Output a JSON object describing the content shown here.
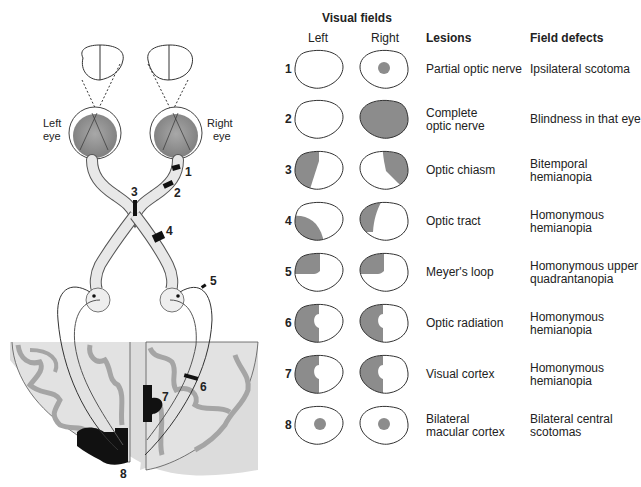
{
  "header": {
    "visual_fields": "Visual fields",
    "left": "Left",
    "right": "Right",
    "lesions": "Lesions",
    "field_defects": "Field defects"
  },
  "anatomy": {
    "left_eye": [
      "Left",
      "eye"
    ],
    "right_eye": [
      "Right",
      "eye"
    ],
    "markers": [
      "1",
      "2",
      "3",
      "4",
      "5",
      "6",
      "7",
      "8"
    ]
  },
  "rows": [
    {
      "num": "1",
      "lesion": [
        "Partial optic nerve"
      ],
      "defect": [
        "Ipsilateral scotoma"
      ],
      "left_field": "normal",
      "right_field": "central-scotoma"
    },
    {
      "num": "2",
      "lesion": [
        "Complete",
        "optic nerve"
      ],
      "defect": [
        "Blindness in that eye"
      ],
      "left_field": "normal",
      "right_field": "full-blind"
    },
    {
      "num": "3",
      "lesion": [
        "Optic chiasm"
      ],
      "defect": [
        "Bitemporal",
        "hemianopia"
      ],
      "left_field": "temporal-left",
      "right_field": "temporal-right"
    },
    {
      "num": "4",
      "lesion": [
        "Optic tract"
      ],
      "defect": [
        "Homonymous",
        "hemianopia"
      ],
      "left_field": "left-half-lower",
      "right_field": "left-half-upper"
    },
    {
      "num": "5",
      "lesion": [
        "Meyer's loop"
      ],
      "defect": [
        "Homonymous upper",
        "quadrantanopia"
      ],
      "left_field": "upper-left-quadrant",
      "right_field": "upper-left-quadrant"
    },
    {
      "num": "6",
      "lesion": [
        "Optic radiation"
      ],
      "defect": [
        "Homonymous",
        "hemianopia"
      ],
      "left_field": "left-half-macular-sparing",
      "right_field": "left-half-macular-sparing"
    },
    {
      "num": "7",
      "lesion": [
        "Visual cortex"
      ],
      "defect": [
        "Homonymous",
        "hemianopia"
      ],
      "left_field": "left-half-macular-sparing",
      "right_field": "left-half-macular-sparing"
    },
    {
      "num": "8",
      "lesion": [
        "Bilateral",
        "macular cortex"
      ],
      "defect": [
        "Bilateral central",
        "scotomas"
      ],
      "left_field": "central-scotoma",
      "right_field": "central-scotoma"
    }
  ],
  "colors": {
    "shade": "#8c8c8c",
    "eye_fill": "#9a9a9a",
    "brain_bg": "#dcdcdc",
    "gyri": "#bdbdbd",
    "lesion_black": "#111111",
    "outline": "#333333"
  }
}
